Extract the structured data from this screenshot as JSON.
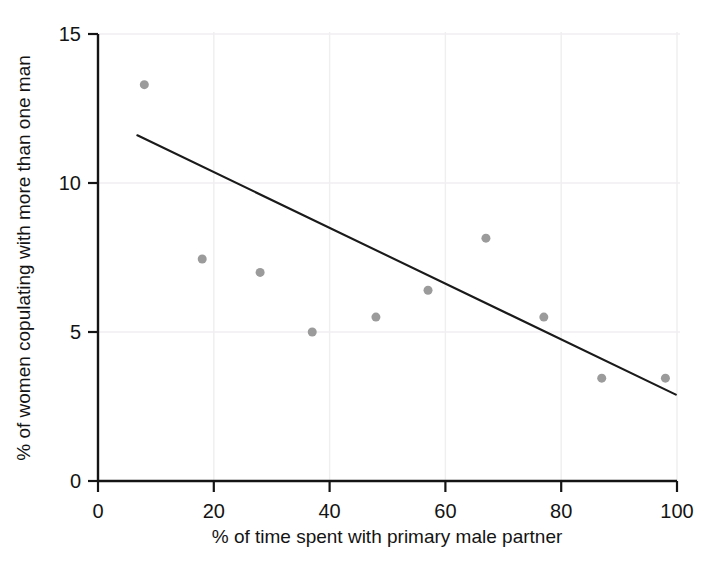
{
  "chart_data": {
    "type": "scatter",
    "title": "",
    "subtitle": "",
    "xlabel": "% of time spent with primary male partner",
    "ylabel": "% of women copulating with more than one man",
    "xlim": [
      0,
      100
    ],
    "ylim": [
      0,
      15
    ],
    "xticks": [
      0,
      20,
      40,
      60,
      80,
      100
    ],
    "yticks": [
      0,
      5,
      10,
      15
    ],
    "xtick_labels": [
      "0",
      "20",
      "40",
      "60",
      "80",
      "100"
    ],
    "ytick_labels": [
      "0",
      "5",
      "10",
      "15"
    ],
    "grid": true,
    "grid_color": "#f0eef0",
    "legend": "none",
    "marker_color": "#9b9b9b",
    "marker_size": 9,
    "axis_color": "#141414",
    "trendline_color": "#1a1a1a",
    "series": [
      {
        "name": "populations",
        "marker": "circle",
        "points": [
          {
            "x": 8,
            "y": 13.3
          },
          {
            "x": 18,
            "y": 7.45
          },
          {
            "x": 28,
            "y": 7.0
          },
          {
            "x": 37,
            "y": 5.0
          },
          {
            "x": 48,
            "y": 5.5
          },
          {
            "x": 57,
            "y": 6.4
          },
          {
            "x": 67,
            "y": 8.15
          },
          {
            "x": 77,
            "y": 5.5
          },
          {
            "x": 87,
            "y": 3.45
          },
          {
            "x": 98,
            "y": 3.45
          }
        ]
      }
    ],
    "trendline": {
      "name": "linear-fit",
      "x0": 6.8,
      "y0": 11.6,
      "x1": 99.8,
      "y1": 2.9
    }
  },
  "axes": {
    "x_axis_name": "x-axis",
    "y_axis_name": "y-axis"
  }
}
